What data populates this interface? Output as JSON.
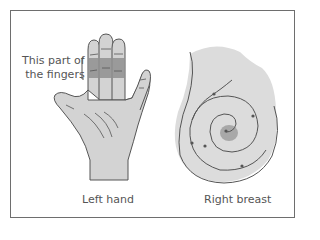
{
  "figure": {
    "panels": [
      {
        "id": "left-hand",
        "caption": "Left hand",
        "callout": {
          "line1": "This part of",
          "line2": "the fingers"
        }
      },
      {
        "id": "right-breast",
        "caption": "Right breast"
      }
    ],
    "colors": {
      "skin": "#d3d3d3",
      "highlight_band": "#8f8f8f",
      "outline": "#555555",
      "nipple": "#a8a8a8",
      "frame": "#6e6e6e"
    }
  }
}
